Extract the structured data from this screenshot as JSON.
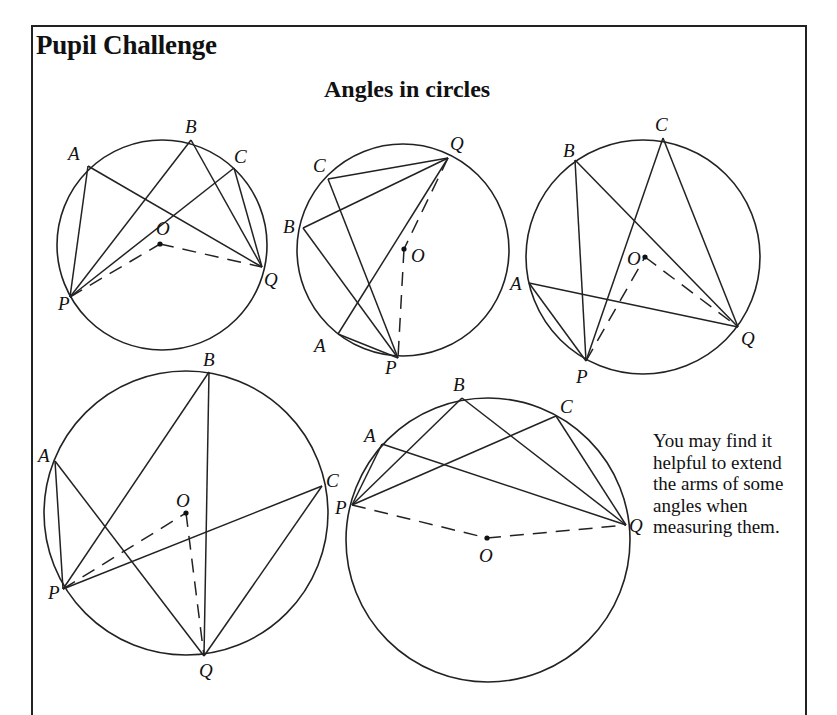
{
  "header": {
    "title": "Pupil Challenge",
    "subtitle": "Angles in circles"
  },
  "note": "You may find it helpful to extend the arms of some angles when measuring them.",
  "diagrams": [
    {
      "id": 1,
      "circle": {
        "cx": 162,
        "cy": 245,
        "r": 105
      },
      "points": {
        "A": [
          88,
          166
        ],
        "B": [
          191,
          140
        ],
        "C": [
          234,
          168
        ],
        "P": [
          70,
          297
        ],
        "Q": [
          262,
          267
        ],
        "O": [
          160,
          244
        ]
      },
      "labels": {
        "A": "A",
        "B": "B",
        "C": "C",
        "P": "P",
        "Q": "Q",
        "O": "O"
      },
      "solid_lines": [
        [
          "A",
          "P"
        ],
        [
          "A",
          "Q"
        ],
        [
          "B",
          "P"
        ],
        [
          "B",
          "Q"
        ],
        [
          "C",
          "P"
        ],
        [
          "C",
          "Q"
        ]
      ],
      "dashed_lines": [
        [
          "P",
          "O"
        ],
        [
          "O",
          "Q"
        ]
      ]
    },
    {
      "id": 2,
      "circle": {
        "cx": 403,
        "cy": 250,
        "r": 106
      },
      "points": {
        "C": [
          328,
          179
        ],
        "Q": [
          448,
          158
        ],
        "B": [
          303,
          228
        ],
        "A": [
          338,
          334
        ],
        "P": [
          398,
          358
        ],
        "O": [
          404,
          249
        ]
      },
      "labels": {
        "A": "A",
        "B": "B",
        "C": "C",
        "P": "P",
        "Q": "Q",
        "O": "O"
      },
      "solid_lines": [
        [
          "C",
          "Q"
        ],
        [
          "B",
          "Q"
        ],
        [
          "A",
          "Q"
        ],
        [
          "C",
          "P"
        ],
        [
          "B",
          "P"
        ],
        [
          "A",
          "P"
        ]
      ],
      "dashed_lines": [
        [
          "Q",
          "O"
        ],
        [
          "O",
          "P"
        ]
      ]
    },
    {
      "id": 3,
      "circle": {
        "cx": 643,
        "cy": 257,
        "r": 117
      },
      "points": {
        "B": [
          575,
          160
        ],
        "C": [
          663,
          138
        ],
        "A": [
          529,
          283
        ],
        "P": [
          586,
          361
        ],
        "Q": [
          738,
          327
        ],
        "O": [
          645,
          257
        ]
      },
      "labels": {
        "A": "A",
        "B": "B",
        "C": "C",
        "P": "P",
        "Q": "Q",
        "O": "O"
      },
      "solid_lines": [
        [
          "B",
          "P"
        ],
        [
          "C",
          "P"
        ],
        [
          "A",
          "P"
        ],
        [
          "B",
          "Q"
        ],
        [
          "C",
          "Q"
        ],
        [
          "A",
          "Q"
        ]
      ],
      "dashed_lines": [
        [
          "P",
          "O"
        ],
        [
          "O",
          "Q"
        ]
      ]
    },
    {
      "id": 4,
      "circle": {
        "cx": 186,
        "cy": 513,
        "r": 142
      },
      "points": {
        "B": [
          209,
          372
        ],
        "A": [
          55,
          461
        ],
        "C": [
          322,
          486
        ],
        "P": [
          63,
          589
        ],
        "Q": [
          204,
          656
        ],
        "O": [
          186,
          513
        ]
      },
      "labels": {
        "A": "A",
        "B": "B",
        "C": "C",
        "P": "P",
        "Q": "Q",
        "O": "O"
      },
      "solid_lines": [
        [
          "A",
          "P"
        ],
        [
          "B",
          "P"
        ],
        [
          "C",
          "P"
        ],
        [
          "A",
          "Q"
        ],
        [
          "B",
          "Q"
        ],
        [
          "C",
          "Q"
        ]
      ],
      "dashed_lines": [
        [
          "P",
          "O"
        ],
        [
          "O",
          "Q"
        ]
      ]
    },
    {
      "id": 5,
      "circle": {
        "cx": 488,
        "cy": 540,
        "r": 142
      },
      "points": {
        "A": [
          382,
          444
        ],
        "B": [
          462,
          398
        ],
        "C": [
          556,
          416
        ],
        "P": [
          352,
          505
        ],
        "Q": [
          626,
          525
        ],
        "O": [
          487,
          538
        ]
      },
      "labels": {
        "A": "A",
        "B": "B",
        "C": "C",
        "P": "P",
        "Q": "Q",
        "O": "O"
      },
      "solid_lines": [
        [
          "A",
          "P"
        ],
        [
          "B",
          "P"
        ],
        [
          "C",
          "P"
        ],
        [
          "A",
          "Q"
        ],
        [
          "B",
          "Q"
        ],
        [
          "C",
          "Q"
        ]
      ],
      "dashed_lines": [
        [
          "P",
          "O"
        ],
        [
          "O",
          "Q"
        ]
      ]
    }
  ],
  "label_positions": [
    {
      "A": [
        68,
        160
      ],
      "B": [
        185,
        133
      ],
      "C": [
        234,
        163
      ],
      "P": [
        58,
        310
      ],
      "Q": [
        264,
        286
      ],
      "O": [
        156,
        235
      ]
    },
    {
      "C": [
        313,
        172
      ],
      "Q": [
        450,
        150
      ],
      "B": [
        283,
        233
      ],
      "A": [
        314,
        352
      ],
      "P": [
        385,
        374
      ],
      "O": [
        411,
        262
      ]
    },
    {
      "B": [
        563,
        157
      ],
      "C": [
        655,
        131
      ],
      "A": [
        510,
        290
      ],
      "P": [
        576,
        383
      ],
      "Q": [
        741,
        345
      ],
      "O": [
        627,
        265
      ]
    },
    {
      "B": [
        203,
        366
      ],
      "A": [
        38,
        462
      ],
      "C": [
        326,
        487
      ],
      "P": [
        48,
        599
      ],
      "Q": [
        199,
        677
      ],
      "O": [
        176,
        507
      ]
    },
    {
      "A": [
        364,
        442
      ],
      "B": [
        453,
        391
      ],
      "C": [
        560,
        413
      ],
      "P": [
        335,
        514
      ],
      "Q": [
        629,
        532
      ],
      "O": [
        479,
        562
      ]
    }
  ]
}
